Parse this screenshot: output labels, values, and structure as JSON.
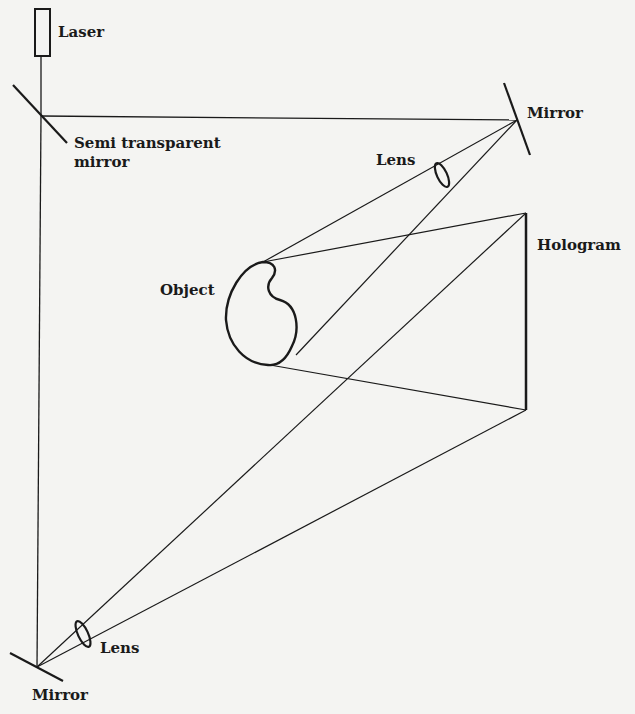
{
  "labels": {
    "laser": "Laser",
    "semi_mirror_1": "Semi transparent",
    "semi_mirror_2": "mirror",
    "mirror_top": "Mirror",
    "lens_top": "Lens",
    "hologram": "Hologram",
    "object": "Object",
    "lens_bottom": "Lens",
    "mirror_bottom": "Mirror"
  },
  "colors": {
    "ink": "#1a1a1a",
    "paper": "#f4f4f2"
  }
}
